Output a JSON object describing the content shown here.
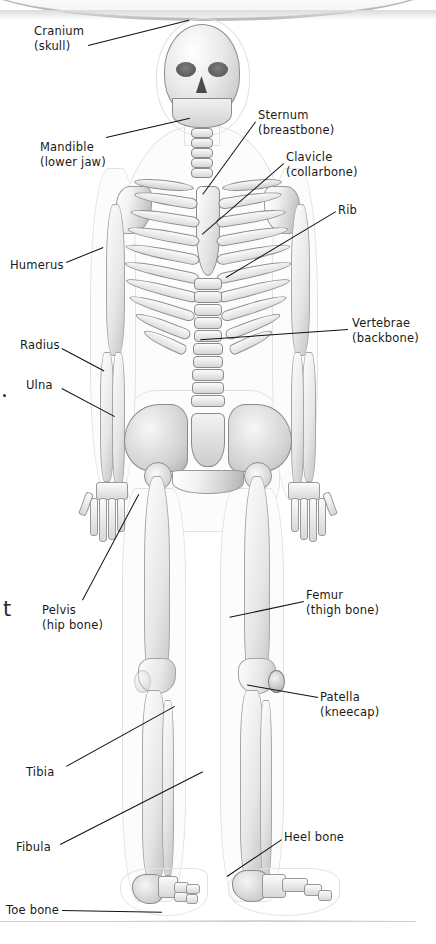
{
  "page": {
    "kind": "scanned-textbook-page",
    "background_color": "#ffffff",
    "ink_color": "#1a1a1a",
    "leader_line_color": "#111111"
  },
  "artifacts": {
    "stray_dot": "•",
    "cut_off_letter": "t"
  },
  "labels": [
    {
      "id": "cranium",
      "line1": "Cranium",
      "line2": "(skull)",
      "side": "left",
      "x": 34,
      "y": 24,
      "leader": {
        "x": 88,
        "y": 45,
        "length": 104,
        "angle": -14
      }
    },
    {
      "id": "mandible",
      "line1": "Mandible",
      "line2": "(lower jaw)",
      "side": "left",
      "x": 40,
      "y": 140,
      "leader": {
        "x": 106,
        "y": 137,
        "length": 86,
        "angle": -13
      }
    },
    {
      "id": "sternum",
      "line1": "Sternum",
      "line2": "(breastbone)",
      "side": "right",
      "x": 258,
      "y": 108,
      "leader": {
        "x": 256,
        "y": 122,
        "length": 90,
        "angle": 126
      }
    },
    {
      "id": "clavicle",
      "line1": "Clavicle",
      "line2": "(collarbone)",
      "side": "right",
      "x": 286,
      "y": 150,
      "leader": {
        "x": 284,
        "y": 164,
        "length": 108,
        "angle": 139
      }
    },
    {
      "id": "rib",
      "line1": "Rib",
      "line2": "",
      "side": "right",
      "x": 338,
      "y": 203,
      "leader": {
        "x": 336,
        "y": 212,
        "length": 128,
        "angle": 149
      }
    },
    {
      "id": "vertebrae",
      "line1": "Vertebrae",
      "line2": "(backbone)",
      "side": "right",
      "x": 352,
      "y": 316,
      "leader": {
        "x": 348,
        "y": 330,
        "length": 148,
        "angle": 176
      }
    },
    {
      "id": "humerus",
      "line1": "Humerus",
      "line2": "",
      "side": "left",
      "x": 10,
      "y": 258,
      "leader": {
        "x": 66,
        "y": 262,
        "length": 40,
        "angle": -22
      }
    },
    {
      "id": "radius",
      "line1": "Radius",
      "line2": "",
      "side": "left",
      "x": 20,
      "y": 338,
      "leader": {
        "x": 62,
        "y": 348,
        "length": 48,
        "angle": 28
      }
    },
    {
      "id": "ulna",
      "line1": "Ulna",
      "line2": "",
      "side": "left",
      "x": 26,
      "y": 378,
      "leader": {
        "x": 62,
        "y": 388,
        "length": 60,
        "angle": 28
      }
    },
    {
      "id": "pelvis",
      "line1": "Pelvis",
      "line2": "(hip bone)",
      "side": "left",
      "x": 42,
      "y": 603,
      "leader": {
        "x": 82,
        "y": 600,
        "length": 120,
        "angle": -62
      }
    },
    {
      "id": "femur",
      "line1": "Femur",
      "line2": "(thigh bone)",
      "side": "right",
      "x": 306,
      "y": 588,
      "leader": {
        "x": 304,
        "y": 602,
        "length": 76,
        "angle": 168
      }
    },
    {
      "id": "patella",
      "line1": "Patella",
      "line2": "(kneecap)",
      "side": "right",
      "x": 320,
      "y": 690,
      "leader": {
        "x": 318,
        "y": 698,
        "length": 72,
        "angle": 190
      }
    },
    {
      "id": "tibia",
      "line1": "Tibia",
      "line2": "",
      "side": "left",
      "x": 26,
      "y": 765,
      "leader": {
        "x": 66,
        "y": 766,
        "length": 124,
        "angle": -29
      }
    },
    {
      "id": "fibula",
      "line1": "Fibula",
      "line2": "",
      "side": "left",
      "x": 16,
      "y": 840,
      "leader": {
        "x": 60,
        "y": 844,
        "length": 160,
        "angle": -27
      }
    },
    {
      "id": "heel-bone",
      "line1": "Heel bone",
      "line2": "",
      "side": "right",
      "x": 284,
      "y": 830,
      "leader": {
        "x": 282,
        "y": 840,
        "length": 66,
        "angle": 146
      }
    },
    {
      "id": "toe-bone",
      "line1": "Toe bone",
      "line2": "",
      "side": "left",
      "x": 6,
      "y": 903,
      "leader": {
        "x": 62,
        "y": 910,
        "length": 100,
        "angle": 1
      }
    }
  ]
}
